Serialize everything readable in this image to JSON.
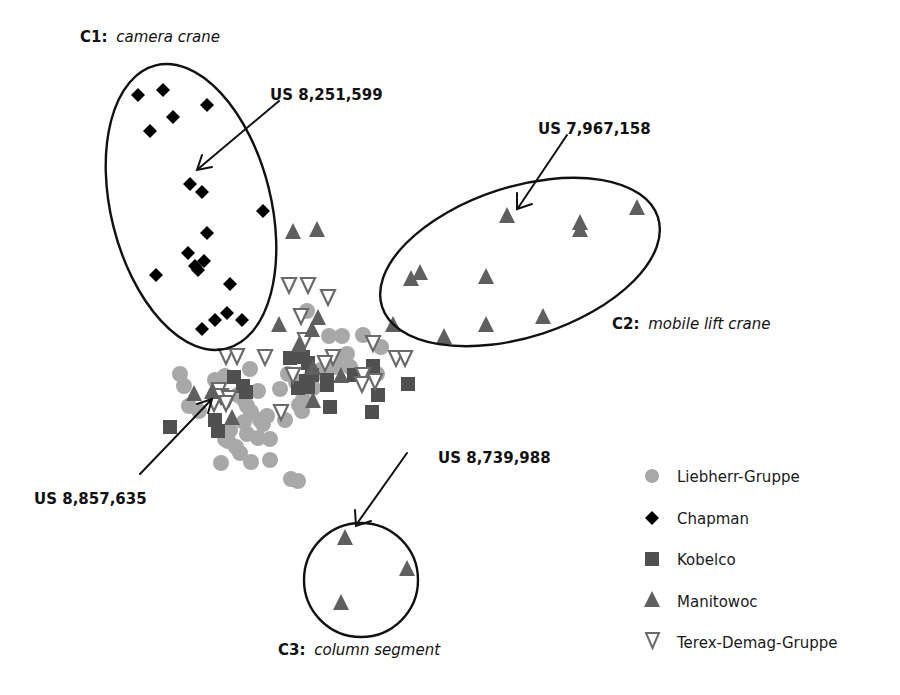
{
  "chart_data": {
    "type": "scatter",
    "title": "",
    "xlabel": "",
    "ylabel": "",
    "axes": "none (patent similarity map, pixel coordinates)",
    "grid": false,
    "legend_position": "bottom-right",
    "colors": {
      "Liebherr-Gruppe": "#a8a8a8",
      "Chapman": "#000000",
      "Kobelco": "#505050",
      "Manitowoc": "#5f5f5f",
      "Terex-Demag-Gruppe": "#6a6a6a"
    },
    "legend": [
      {
        "name": "Liebherr-Gruppe",
        "marker": "circle"
      },
      {
        "name": "Chapman",
        "marker": "diamond"
      },
      {
        "name": "Kobelco",
        "marker": "square"
      },
      {
        "name": "Manitowoc",
        "marker": "triangle-up"
      },
      {
        "name": "Terex-Demag-Gruppe",
        "marker": "triangle-down-open"
      }
    ],
    "series": [
      {
        "name": "Chapman",
        "marker": "diamond",
        "points": [
          [
            138,
            95
          ],
          [
            163,
            90
          ],
          [
            207,
            105
          ],
          [
            173,
            117
          ],
          [
            150,
            131
          ],
          [
            190,
            184
          ],
          [
            202,
            192
          ],
          [
            263,
            211
          ],
          [
            207,
            233
          ],
          [
            188,
            253
          ],
          [
            204,
            261
          ],
          [
            198,
            270
          ],
          [
            195,
            266
          ],
          [
            156,
            275
          ],
          [
            230,
            284
          ],
          [
            227,
            313
          ],
          [
            215,
            320
          ],
          [
            242,
            320
          ],
          [
            202,
            329
          ]
        ]
      },
      {
        "name": "Manitowoc",
        "marker": "triangle-up",
        "points": [
          [
            293,
            232
          ],
          [
            317,
            230
          ],
          [
            507,
            216
          ],
          [
            580,
            223
          ],
          [
            580,
            230
          ],
          [
            637,
            208
          ],
          [
            411,
            279
          ],
          [
            420,
            273
          ],
          [
            486,
            277
          ],
          [
            393,
            325
          ],
          [
            444,
            337
          ],
          [
            486,
            325
          ],
          [
            543,
            317
          ],
          [
            279,
            325
          ],
          [
            318,
            318
          ],
          [
            212,
            392
          ],
          [
            194,
            394
          ],
          [
            232,
            418
          ],
          [
            313,
            368
          ],
          [
            341,
            376
          ],
          [
            299,
            345
          ],
          [
            313,
            401
          ],
          [
            345,
            538
          ],
          [
            407,
            569
          ],
          [
            341,
            603
          ],
          [
            312,
            330
          ]
        ]
      },
      {
        "name": "Kobelco",
        "marker": "square",
        "points": [
          [
            170,
            427
          ],
          [
            234,
            377
          ],
          [
            243,
            386
          ],
          [
            246,
            392
          ],
          [
            218,
            431
          ],
          [
            215,
            420
          ],
          [
            290,
            358
          ],
          [
            308,
            363
          ],
          [
            312,
            375
          ],
          [
            308,
            387
          ],
          [
            327,
            385
          ],
          [
            327,
            380
          ],
          [
            306,
            381
          ],
          [
            298,
            388
          ],
          [
            354,
            375
          ],
          [
            373,
            366
          ],
          [
            378,
            395
          ],
          [
            372,
            412
          ],
          [
            330,
            407
          ],
          [
            408,
            384
          ],
          [
            303,
            357
          ]
        ]
      },
      {
        "name": "Terex-Demag-Gruppe",
        "marker": "triangle-down-open",
        "points": [
          [
            289,
            285
          ],
          [
            308,
            285
          ],
          [
            328,
            297
          ],
          [
            301,
            316
          ],
          [
            305,
            340
          ],
          [
            265,
            357
          ],
          [
            333,
            357
          ],
          [
            293,
            375
          ],
          [
            373,
            343
          ],
          [
            396,
            358
          ],
          [
            405,
            358
          ],
          [
            375,
            381
          ],
          [
            363,
            375
          ],
          [
            226,
            356
          ],
          [
            237,
            356
          ],
          [
            219,
            390
          ],
          [
            221,
            396
          ],
          [
            229,
            398
          ],
          [
            226,
            403
          ],
          [
            281,
            412
          ],
          [
            325,
            363
          ],
          [
            362,
            384
          ],
          [
            214,
            403
          ]
        ]
      },
      {
        "name": "Liebherr-Gruppe",
        "marker": "circle",
        "points": [
          [
            180,
            374
          ],
          [
            184,
            386
          ],
          [
            189,
            406
          ],
          [
            199,
            411
          ],
          [
            225,
            376
          ],
          [
            250,
            369
          ],
          [
            307,
            311
          ],
          [
            329,
            336
          ],
          [
            342,
            336
          ],
          [
            363,
            335
          ],
          [
            311,
            377
          ],
          [
            321,
            370
          ],
          [
            335,
            367
          ],
          [
            280,
            389
          ],
          [
            288,
            374
          ],
          [
            296,
            382
          ],
          [
            326,
            376
          ],
          [
            313,
            388
          ],
          [
            350,
            367
          ],
          [
            377,
            374
          ],
          [
            381,
            347
          ],
          [
            347,
            354
          ],
          [
            336,
            360
          ],
          [
            303,
            400
          ],
          [
            299,
            405
          ],
          [
            302,
            411
          ],
          [
            238,
            395
          ],
          [
            244,
            400
          ],
          [
            251,
            412
          ],
          [
            260,
            420
          ],
          [
            267,
            416
          ],
          [
            285,
            420
          ],
          [
            230,
            430
          ],
          [
            247,
            434
          ],
          [
            258,
            438
          ],
          [
            270,
            439
          ],
          [
            263,
            424
          ],
          [
            240,
            453
          ],
          [
            221,
            463
          ],
          [
            251,
            462
          ],
          [
            270,
            460
          ],
          [
            291,
            479
          ],
          [
            298,
            481
          ],
          [
            236,
            447
          ],
          [
            225,
            439
          ],
          [
            244,
            422
          ],
          [
            247,
            406
          ],
          [
            258,
            391
          ],
          [
            215,
            380
          ],
          [
            228,
            441
          ]
        ]
      }
    ],
    "clusters": [
      {
        "id": "C1",
        "label": "C1:",
        "name": "camera crane",
        "shape": "ellipse",
        "cx": 191,
        "cy": 207,
        "rx": 80,
        "ry": 146,
        "rotation": -14
      },
      {
        "id": "C2",
        "label": "C2:",
        "name": "mobile lift crane",
        "shape": "ellipse",
        "cx": 520,
        "cy": 262,
        "rx": 145,
        "ry": 75,
        "rotation": -18
      },
      {
        "id": "C3",
        "label": "C3:",
        "name": "column segment",
        "shape": "circle",
        "cx": 361,
        "cy": 580,
        "r": 57
      }
    ],
    "annotations": [
      {
        "text": "US 8,251,599",
        "points_to": "Chapman point in C1",
        "x": 270,
        "y": 94
      },
      {
        "text": "US 7,967,158",
        "points_to": "Manitowoc point in C2",
        "x": 540,
        "y": 128
      },
      {
        "text": "US 8,857,635",
        "points_to": "point in central cluster",
        "x": 34,
        "y": 498
      },
      {
        "text": "US 8,739,988",
        "points_to": "Manitowoc point in C3",
        "x": 440,
        "y": 457
      }
    ]
  },
  "labels": {
    "c1_prefix": "C1:",
    "c1_name": "camera crane",
    "c2_prefix": "C2:",
    "c2_name": "mobile lift crane",
    "c3_prefix": "C3:",
    "c3_name": "column segment",
    "ann1": "US 8,251,599",
    "ann2": "US 7,967,158",
    "ann3": "US 8,857,635",
    "ann4": "US 8,739,988"
  },
  "legend": {
    "items": [
      {
        "label": "Liebherr-Gruppe"
      },
      {
        "label": "Chapman"
      },
      {
        "label": "Kobelco"
      },
      {
        "label": "Manitowoc"
      },
      {
        "label": "Terex-Demag-Gruppe"
      }
    ]
  }
}
